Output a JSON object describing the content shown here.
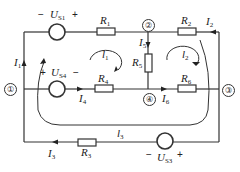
{
  "diagram": {
    "type": "circuit",
    "nodes": [
      {
        "id": "1",
        "label": "①"
      },
      {
        "id": "2",
        "label": "②"
      },
      {
        "id": "3",
        "label": "③"
      },
      {
        "id": "4",
        "label": "④"
      }
    ],
    "sources": [
      {
        "name": "US1",
        "main": "U",
        "sub": "S1",
        "neg": "−",
        "pos": "+"
      },
      {
        "name": "US4",
        "main": "U",
        "sub": "S4",
        "neg": "−",
        "pos": "+"
      },
      {
        "name": "US3",
        "main": "U",
        "sub": "S3",
        "neg": "−",
        "pos": "+"
      }
    ],
    "resistors": [
      {
        "name": "R1",
        "main": "R",
        "sub": "1"
      },
      {
        "name": "R2",
        "main": "R",
        "sub": "2"
      },
      {
        "name": "R3",
        "main": "R",
        "sub": "3"
      },
      {
        "name": "R4",
        "main": "R",
        "sub": "4"
      },
      {
        "name": "R5",
        "main": "R",
        "sub": "5"
      },
      {
        "name": "R6",
        "main": "R",
        "sub": "6"
      }
    ],
    "branch_currents": [
      {
        "name": "I1",
        "main": "I",
        "sub": "1"
      },
      {
        "name": "I2",
        "main": "I",
        "sub": "2"
      },
      {
        "name": "I3",
        "main": "I",
        "sub": "3"
      },
      {
        "name": "I4",
        "main": "I",
        "sub": "4"
      },
      {
        "name": "I5",
        "main": "I",
        "sub": "5"
      },
      {
        "name": "I6",
        "main": "I",
        "sub": "6"
      }
    ],
    "loop_currents": [
      {
        "name": "l1",
        "main": "l",
        "sub": "1"
      },
      {
        "name": "l2",
        "main": "l",
        "sub": "2"
      },
      {
        "name": "l3",
        "main": "l",
        "sub": "3"
      }
    ],
    "line_color": "#333333"
  }
}
